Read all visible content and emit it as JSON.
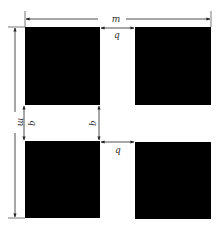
{
  "diagram": {
    "labels": {
      "period_horizontal": "m",
      "period_vertical": "m",
      "gap_top": "q",
      "gap_left_vertical": "q",
      "gap_right_vertical": "q",
      "gap_bottom": "q"
    },
    "colors": {
      "block": "#000000",
      "line": "#333333",
      "background": "#ffffff"
    },
    "blocks": [
      {
        "name": "top-left",
        "x": 25,
        "y": 27,
        "w": 75,
        "h": 78
      },
      {
        "name": "top-right",
        "x": 135,
        "y": 27,
        "w": 76,
        "h": 78
      },
      {
        "name": "bottom-left",
        "x": 25,
        "y": 141,
        "w": 75,
        "h": 77
      },
      {
        "name": "bottom-right",
        "x": 135,
        "y": 142,
        "w": 76,
        "h": 77
      }
    ]
  }
}
